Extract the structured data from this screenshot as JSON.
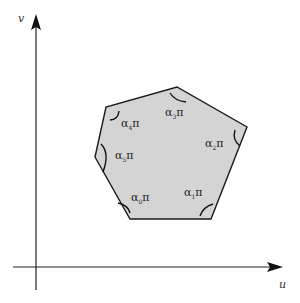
{
  "diagram": {
    "axes": {
      "x_label": "u",
      "y_label": "v"
    },
    "polygon": {
      "fill": "#d4d4d4",
      "stroke": "#1a1a1a",
      "vertices": [
        [
          130,
          219
        ],
        [
          211,
          219
        ],
        [
          247,
          127
        ],
        [
          177,
          87
        ],
        [
          106,
          107
        ],
        [
          95,
          157
        ]
      ]
    },
    "angles": [
      {
        "greek": "α",
        "sub": "0",
        "tail": "π"
      },
      {
        "greek": "α",
        "sub": "1",
        "tail": "π"
      },
      {
        "greek": "α",
        "sub": "2",
        "tail": "π"
      },
      {
        "greek": "α",
        "sub": "3",
        "tail": "π"
      },
      {
        "greek": "α",
        "sub": "4",
        "tail": "π"
      },
      {
        "greek": "α",
        "sub": "5",
        "tail": "π"
      }
    ]
  }
}
